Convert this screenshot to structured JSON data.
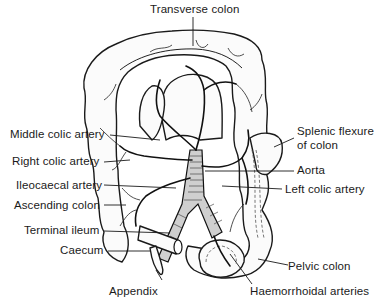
{
  "figure": {
    "labels": {
      "transverse_colon": "Transverse colon",
      "middle_colic_artery": "Middle colic artery",
      "right_colic_artery": "Right colic artery",
      "ileocaecal_artery": "Ileocaecal artery",
      "ascending_colon": "Ascending colon",
      "terminal_ileum": "Terminal ileum",
      "caecum": "Caecum",
      "appendix": "Appendix",
      "splenic_flexure_line1": "Splenic flexure",
      "splenic_flexure_line2": "of colon",
      "aorta": "Aorta",
      "left_colic_artery": "Left colic artery",
      "pelvic_colon": "Pelvic colon",
      "haemorrhoidal_arteries": "Haemorrhoidal arteries"
    },
    "colors": {
      "ink": "#1a1a1a",
      "background": "#ffffff"
    }
  }
}
